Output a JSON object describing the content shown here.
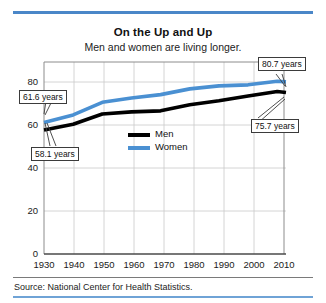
{
  "figure": {
    "title": "On the Up and Up",
    "subtitle": "Men and women are living longer.",
    "source": "Source: National Center for Health Statistics.",
    "accent_color": "#4a87c8",
    "rule_color_bottom": "#6fa3d6"
  },
  "legend": {
    "position": "inside-center",
    "entries": [
      {
        "label": "Men",
        "color": "#000000"
      },
      {
        "label": "Women",
        "color": "#4a90d2"
      }
    ]
  },
  "callouts": [
    {
      "name": "women-1930",
      "text": "61.6 years"
    },
    {
      "name": "men-1930",
      "text": "58.1 years"
    },
    {
      "name": "women-2013",
      "text": "80.7 years"
    },
    {
      "name": "men-2013",
      "text": "75.7 years"
    }
  ],
  "chart_data": {
    "type": "line",
    "title": "On the Up and Up",
    "subtitle": "Men and women are living longer.",
    "xlabel": "",
    "ylabel": "",
    "xlim": [
      1930,
      2013
    ],
    "ylim": [
      0,
      90
    ],
    "xticks": [
      1930,
      1940,
      1950,
      1960,
      1970,
      1980,
      1990,
      2000,
      2010
    ],
    "yticks": [
      0,
      20,
      40,
      60,
      80
    ],
    "grid": true,
    "legend_entries": [
      "Men",
      "Women"
    ],
    "x": [
      1930,
      1940,
      1950,
      1960,
      1970,
      1980,
      1990,
      2000,
      2010,
      2013
    ],
    "series": [
      {
        "name": "Men",
        "color": "#000000",
        "values": [
          58.1,
          60.8,
          65.6,
          66.6,
          67.1,
          70.0,
          71.8,
          74.1,
          76.2,
          75.7
        ]
      },
      {
        "name": "Women",
        "color": "#4a90d2",
        "values": [
          61.6,
          65.2,
          71.1,
          73.1,
          74.7,
          77.4,
          78.8,
          79.3,
          81.0,
          80.7
        ]
      }
    ],
    "annotations": [
      {
        "series": "Women",
        "x": 1930,
        "y": 61.6,
        "text": "61.6 years"
      },
      {
        "series": "Men",
        "x": 1930,
        "y": 58.1,
        "text": "58.1 years"
      },
      {
        "series": "Women",
        "x": 2013,
        "y": 80.7,
        "text": "80.7 years"
      },
      {
        "series": "Men",
        "x": 2013,
        "y": 75.7,
        "text": "75.7 years"
      }
    ]
  },
  "ticks": {
    "y": [
      "80",
      "60",
      "40",
      "20",
      "0"
    ],
    "x": [
      "1930",
      "1940",
      "1950",
      "1960",
      "1970",
      "1980",
      "1990",
      "2000",
      "2010"
    ]
  }
}
